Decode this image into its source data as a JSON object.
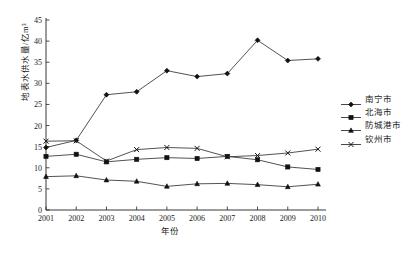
{
  "chart_data": {
    "type": "line",
    "title": "",
    "xlabel": "年份",
    "ylabel": "地表水供水量/亿m³",
    "x": [
      2001,
      2002,
      2003,
      2004,
      2005,
      2006,
      2007,
      2008,
      2009,
      2010
    ],
    "xtick_labels": [
      "2001",
      "2002",
      "2003",
      "2004",
      "2005",
      "2006",
      "2007",
      "2008",
      "2009",
      "2010"
    ],
    "ytick_labels": [
      "0",
      "5",
      "10",
      "15",
      "20",
      "25",
      "30",
      "35",
      "40",
      "45"
    ],
    "ylim": [
      0,
      45
    ],
    "ytick_step": 5,
    "grid": false,
    "legend_position": "right",
    "series": [
      {
        "name": "南宁市",
        "marker": "diamond",
        "values": [
          14.8,
          16.5,
          27.3,
          28.0,
          33.0,
          31.6,
          32.3,
          40.2,
          35.4,
          35.8
        ]
      },
      {
        "name": "北海市",
        "marker": "square",
        "values": [
          12.7,
          13.2,
          11.4,
          12.0,
          12.4,
          12.2,
          12.7,
          11.9,
          10.2,
          9.6
        ]
      },
      {
        "name": "防城港市",
        "marker": "triangle",
        "values": [
          7.9,
          8.1,
          7.1,
          6.8,
          5.6,
          6.2,
          6.3,
          6.0,
          5.5,
          6.1
        ]
      },
      {
        "name": "钦州市",
        "marker": "cross",
        "values": [
          16.3,
          16.4,
          11.6,
          14.3,
          14.8,
          14.6,
          12.6,
          12.9,
          13.5,
          14.4
        ]
      }
    ]
  },
  "legend": {
    "items": [
      {
        "label": "南宁市"
      },
      {
        "label": "北海市"
      },
      {
        "label": "防城港市"
      },
      {
        "label": "钦州市"
      }
    ]
  },
  "caption": {
    "text": ""
  },
  "colors": {
    "line": "#333333",
    "marker": "#111111",
    "axis": "#222222",
    "background": "#ffffff"
  }
}
